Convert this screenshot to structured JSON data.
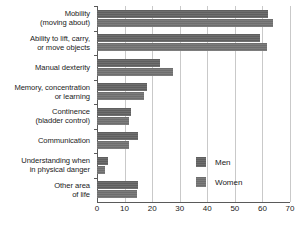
{
  "chart_data": {
    "type": "bar",
    "orientation": "horizontal",
    "title": "",
    "subtitle": "",
    "xlabel": "",
    "ylabel": "",
    "xlim": [
      0,
      70
    ],
    "xticks": [
      0,
      10,
      20,
      30,
      40,
      50,
      60,
      70
    ],
    "xtick_labels": [
      "0",
      "10",
      "20",
      "30",
      "40",
      "50",
      "60",
      "70"
    ],
    "grid": true,
    "grid_axis": "x",
    "legend_position": "center-right",
    "categories": [
      "Mobility\n(moving about)",
      "Ability to lift, carry,\nor move objects",
      "Manual dexterity",
      "Memory, concentration\nor learning",
      "Continence\n(bladder control)",
      "Communication",
      "Understanding when\nin physical danger",
      "Other area\nof life"
    ],
    "series": [
      {
        "name": "Men",
        "color": "#5f5f5f",
        "values": [
          62,
          59,
          23,
          18,
          12.5,
          15,
          4,
          15
        ]
      },
      {
        "name": "Women",
        "color": "#6e6e6e",
        "values": [
          64,
          61.5,
          27.5,
          17,
          11.5,
          11.5,
          3,
          14.5
        ]
      }
    ]
  },
  "legend": {
    "items": [
      {
        "label": "Men",
        "swatch": "men-legend-swatch"
      },
      {
        "label": "Women",
        "swatch": "women-legend-swatch"
      }
    ]
  },
  "axis": {
    "x_tick_labels": [
      "0",
      "10",
      "20",
      "30",
      "40",
      "50",
      "60",
      "70"
    ]
  }
}
